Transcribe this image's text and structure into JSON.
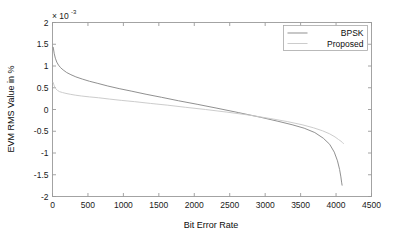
{
  "chart_data": {
    "type": "line",
    "title": "",
    "xlabel": "Bit Error Rate",
    "ylabel": "EVM RMS Value in %",
    "y_multiplier_base": "× 10",
    "y_multiplier_exp": "-3",
    "y_multiplier_text": "× 10⁻³",
    "xlim": [
      0,
      4500
    ],
    "ylim": [
      -0.002,
      0.002
    ],
    "xticks": [
      0,
      500,
      1000,
      1500,
      2000,
      2500,
      3000,
      3500,
      4000,
      4500
    ],
    "xtick_labels": [
      "0",
      "500",
      "1000",
      "1500",
      "2000",
      "2500",
      "3000",
      "3500",
      "4000",
      "4500"
    ],
    "yticks": [
      -0.002,
      -0.0015,
      -0.001,
      -0.0005,
      0,
      0.0005,
      0.001,
      0.0015,
      0.002
    ],
    "ytick_labels": [
      "-2",
      "-1.5",
      "-1",
      "-0.5",
      "0",
      "0.5",
      "1",
      "1.5",
      "2"
    ],
    "grid": false,
    "legend_position": "top-right",
    "series": [
      {
        "name": "BPSK",
        "color": "#8a8a8a",
        "x": [
          10,
          25,
          40,
          60,
          85,
          115,
          150,
          200,
          260,
          330,
          420,
          520,
          640,
          780,
          940,
          1120,
          1320,
          1540,
          1780,
          2040,
          2320,
          2620,
          2940,
          3180,
          3380,
          3550,
          3700,
          3820,
          3910,
          3975,
          4020,
          4050,
          4068,
          4078,
          4085
        ],
        "y": [
          0.00143,
          0.00128,
          0.00118,
          0.00109,
          0.00102,
          0.00096,
          0.00091,
          0.00085,
          0.0008,
          0.00075,
          0.0007,
          0.00065,
          0.0006,
          0.00054,
          0.00048,
          0.00042,
          0.00035,
          0.00028,
          0.0002,
          0.00012,
          3e-05,
          -7e-05,
          -0.00018,
          -0.00027,
          -0.00035,
          -0.00043,
          -0.00053,
          -0.00066,
          -0.0008,
          -0.00098,
          -0.00118,
          -0.00138,
          -0.00155,
          -0.00167,
          -0.00174
        ]
      },
      {
        "name": "Proposed",
        "color": "#c9c9c9",
        "x": [
          10,
          25,
          45,
          70,
          100,
          140,
          190,
          250,
          320,
          410,
          520,
          650,
          800,
          970,
          1160,
          1380,
          1620,
          1880,
          2160,
          2460,
          2780,
          3080,
          3320,
          3520,
          3680,
          3810,
          3910,
          3985,
          4035,
          4070,
          4090,
          4105
        ],
        "y": [
          0.00062,
          0.00054,
          0.00048,
          0.00044,
          0.00041,
          0.00039,
          0.00037,
          0.00035,
          0.00033,
          0.00031,
          0.00029,
          0.00027,
          0.00024,
          0.00021,
          0.00018,
          0.00014,
          0.0001,
          5e-05,
          0.0,
          -6e-05,
          -0.00013,
          -0.00021,
          -0.00028,
          -0.00035,
          -0.00042,
          -0.00049,
          -0.00056,
          -0.00063,
          -0.00069,
          -0.00073,
          -0.00076,
          -0.00078
        ]
      }
    ]
  },
  "legend": {
    "items": [
      {
        "label": "BPSK",
        "color": "#8a8a8a"
      },
      {
        "label": "Proposed",
        "color": "#c9c9c9"
      }
    ]
  },
  "axes": {
    "box_color": "#9a9a9a",
    "tick_color": "#9a9a9a"
  }
}
